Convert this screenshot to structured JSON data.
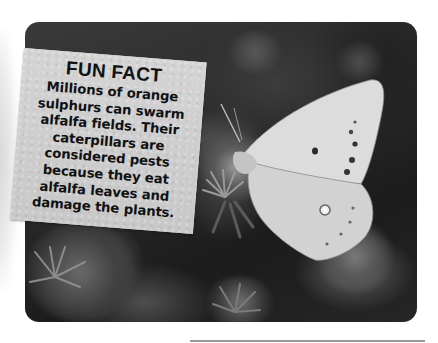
{
  "card": {
    "title": "FUN FACT",
    "lines": [
      "Millions of orange",
      "sulphurs can swarm",
      "alfalfa fields. Their",
      "caterpillars are",
      "considered pests",
      "because they eat",
      "alfalfa leaves and",
      "damage the plants."
    ]
  },
  "photo": {
    "subject": "orange sulphur butterfly on aster flower",
    "tone": "grayscale"
  },
  "colors": {
    "card_bg": "#cfcfcf",
    "text": "#111111",
    "rule": "#9a9a9a"
  }
}
